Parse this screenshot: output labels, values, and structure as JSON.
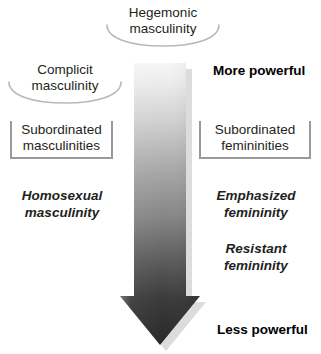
{
  "diagram": {
    "arrow": {
      "name": "power-gradient-arrow",
      "direction": "down",
      "gradient_from": "#f4f4f4",
      "gradient_mid": "#8c8c8c",
      "gradient_to": "#2b2b2b",
      "shadow_color": "#d9d9d9"
    },
    "swoosh_labels": [
      {
        "id": "hegemonic",
        "name": "swoosh-label-hegemonic-masculinity",
        "line1": "Hegemonic",
        "line2": "masculinity",
        "arc_color": "#b3b3b3"
      },
      {
        "id": "complicit",
        "name": "swoosh-label-complicit-masculinity",
        "line1": "Complicit",
        "line2": "masculinity",
        "arc_color": "#b3b3b3"
      }
    ],
    "bracket_labels": [
      {
        "id": "subordinated_masculinities",
        "name": "bracket-subordinated-masculinities",
        "line1": "Subordinated",
        "line2": "masculinities",
        "border_color": "#9a9a9a"
      },
      {
        "id": "subordinated_femininities",
        "name": "bracket-subordinated-femininities",
        "line1": "Subordinated",
        "line2": "femininities",
        "border_color": "#9a9a9a"
      }
    ],
    "italic_labels": [
      {
        "id": "homosexual_masculinity",
        "name": "label-homosexual-masculinity",
        "line1": "Homosexual",
        "line2": "masculinity"
      },
      {
        "id": "emphasized_femininity",
        "name": "label-emphasized-femininity",
        "line1": "Emphasized",
        "line2": "femininity"
      },
      {
        "id": "resistant_femininity",
        "name": "label-resistant-femininity",
        "line1": "Resistant",
        "line2": "femininity"
      }
    ],
    "power_labels": {
      "top": "More powerful",
      "bottom": "Less powerful"
    }
  }
}
